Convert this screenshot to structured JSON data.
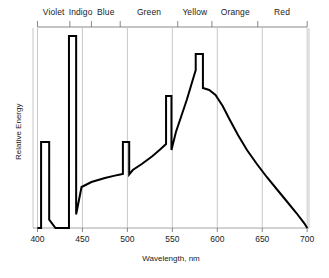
{
  "chart_data": {
    "type": "line",
    "title": "",
    "xlabel": "Wavelength, nm",
    "ylabel": "Relative Energy",
    "xlim": [
      395,
      702
    ],
    "ylim": [
      0,
      1.0
    ],
    "grid": true,
    "legend_position": "none",
    "xticks": [
      400,
      450,
      500,
      550,
      600,
      650,
      700
    ],
    "xtick_labels": [
      "400",
      "450",
      "500",
      "550",
      "600",
      "650",
      "700"
    ],
    "yticks": [],
    "ytick_labels": [],
    "color_bands": [
      {
        "label": "Violet",
        "start": 400,
        "end": 436,
        "center": 418
      },
      {
        "label": "Indigo",
        "start": 436,
        "end": 460,
        "center": 448
      },
      {
        "label": "Blue",
        "start": 460,
        "end": 492,
        "center": 476
      },
      {
        "label": "Green",
        "start": 492,
        "end": 556,
        "center": 524
      },
      {
        "label": "Yellow",
        "start": 556,
        "end": 594,
        "center": 575
      },
      {
        "label": "Orange",
        "start": 594,
        "end": 645,
        "center": 620
      },
      {
        "label": "Red",
        "start": 645,
        "end": 700,
        "center": 672
      }
    ],
    "series": [
      {
        "name": "Relative Energy",
        "color": "#000000",
        "points": [
          [
            400,
            0.0
          ],
          [
            404,
            0.0
          ],
          [
            404,
            0.43
          ],
          [
            413,
            0.43
          ],
          [
            413,
            0.042
          ],
          [
            420,
            0.0
          ],
          [
            435,
            0.0
          ],
          [
            435,
            0.96
          ],
          [
            443,
            0.96
          ],
          [
            443,
            0.068
          ],
          [
            449,
            0.205
          ],
          [
            460,
            0.23
          ],
          [
            475,
            0.25
          ],
          [
            486,
            0.262
          ],
          [
            492,
            0.268
          ],
          [
            495,
            0.27
          ],
          [
            495,
            0.43
          ],
          [
            502,
            0.43
          ],
          [
            502,
            0.268
          ],
          [
            506,
            0.29
          ],
          [
            516,
            0.32
          ],
          [
            528,
            0.36
          ],
          [
            537,
            0.395
          ],
          [
            543,
            0.42
          ],
          [
            543,
            0.66
          ],
          [
            549,
            0.66
          ],
          [
            549,
            0.39
          ],
          [
            554,
            0.48
          ],
          [
            560,
            0.56
          ],
          [
            566,
            0.64
          ],
          [
            572,
            0.73
          ],
          [
            576,
            0.79
          ],
          [
            576,
            0.87
          ],
          [
            584,
            0.87
          ],
          [
            584,
            0.7
          ],
          [
            591,
            0.69
          ],
          [
            598,
            0.665
          ],
          [
            606,
            0.61
          ],
          [
            614,
            0.54
          ],
          [
            623,
            0.465
          ],
          [
            633,
            0.39
          ],
          [
            644,
            0.32
          ],
          [
            655,
            0.255
          ],
          [
            666,
            0.195
          ],
          [
            677,
            0.135
          ],
          [
            688,
            0.075
          ],
          [
            697,
            0.022
          ],
          [
            700,
            0.0
          ]
        ]
      }
    ]
  },
  "style": {
    "curve_color": "#000000",
    "grid_color": "#b0b0b0",
    "axis_color": "#9a9a9a",
    "tick_color": "#6b6b6b",
    "text_color": "#222222",
    "background": "#ffffff"
  }
}
